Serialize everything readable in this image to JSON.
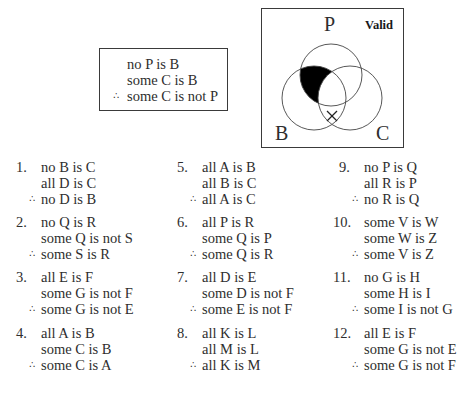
{
  "example": {
    "premises": [
      "no P is B",
      "some C is B"
    ],
    "therefore_symbol": "∴",
    "conclusion": "some C is not P"
  },
  "venn": {
    "labels": {
      "top": "P",
      "left": "B",
      "right": "C"
    },
    "verdict": "Valid",
    "shaded_region": "P∩B outside C",
    "x_mark": "×",
    "x_mark_region": "B∩C outside P"
  },
  "exercises": [
    {
      "number": "1.",
      "lines": [
        "no B is C",
        "all D is C"
      ],
      "conclusion": "no D is B"
    },
    {
      "number": "2.",
      "lines": [
        "no Q is R",
        "some Q is not S"
      ],
      "conclusion": "some S is R"
    },
    {
      "number": "3.",
      "lines": [
        "all E is F",
        "some G is not F"
      ],
      "conclusion": "some G is not E"
    },
    {
      "number": "4.",
      "lines": [
        "all A is B",
        "some C is B"
      ],
      "conclusion": "some C is A"
    },
    {
      "number": "5.",
      "lines": [
        "all A is B",
        "all B is C"
      ],
      "conclusion": "all A is C"
    },
    {
      "number": "6.",
      "lines": [
        "all P is R",
        "some Q is P"
      ],
      "conclusion": "some Q is R"
    },
    {
      "number": "7.",
      "lines": [
        "all D is E",
        "some D is not F"
      ],
      "conclusion": "some E is not F"
    },
    {
      "number": "8.",
      "lines": [
        "all K is L",
        "all M is L"
      ],
      "conclusion": "all K is M"
    },
    {
      "number": "9.",
      "lines": [
        "no P is Q",
        "all R is P"
      ],
      "conclusion": "no R is Q"
    },
    {
      "number": "10.",
      "lines": [
        "some V is W",
        "some W is Z"
      ],
      "conclusion": "some V is Z"
    },
    {
      "number": "11.",
      "lines": [
        "no G is H",
        "some H is I"
      ],
      "conclusion": "some I is not G"
    },
    {
      "number": "12.",
      "lines": [
        "all E is F",
        "some G is not E"
      ],
      "conclusion": "some G is not F"
    }
  ]
}
